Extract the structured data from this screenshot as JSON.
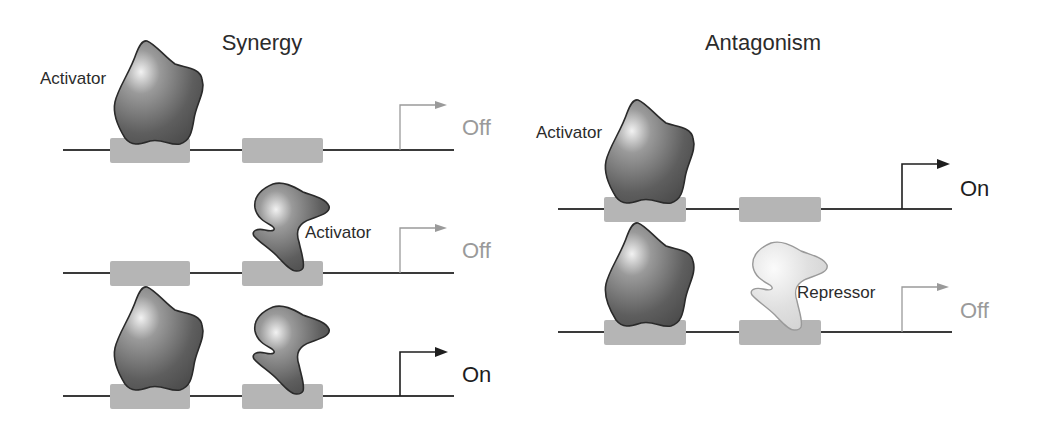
{
  "panels": {
    "synergy": {
      "title": "Synergy",
      "rows": [
        {
          "bound_proteins": [
            "Activator (site 1)"
          ],
          "protein_label": "Activator",
          "transcription_state": "Off"
        },
        {
          "bound_proteins": [
            "Activator (site 2)"
          ],
          "protein_label": "Activator",
          "transcription_state": "Off"
        },
        {
          "bound_proteins": [
            "Activator (site 1)",
            "Activator (site 2)"
          ],
          "protein_label": "",
          "transcription_state": "On"
        }
      ]
    },
    "antagonism": {
      "title": "Antagonism",
      "rows": [
        {
          "bound_proteins": [
            "Activator (site 1)"
          ],
          "protein_label": "Activator",
          "transcription_state": "On"
        },
        {
          "bound_proteins": [
            "Activator (site 1)",
            "Repressor (site 2)"
          ],
          "protein_label": "Repressor",
          "transcription_state": "Off"
        }
      ]
    }
  },
  "colors": {
    "dna_line": "#3a3a3a",
    "binding_site": "#b5b5b5",
    "activator_fill_dark": "#555555",
    "activator_fill_light": "#e8e8e8",
    "repressor_fill": "#d6d6d6",
    "state_on": "#1e1e1e",
    "state_off": "#9a9a9a"
  }
}
